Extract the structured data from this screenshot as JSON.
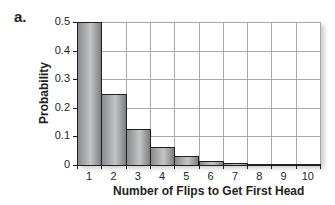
{
  "panel_label": "a.",
  "chart_data": {
    "type": "bar",
    "title": "",
    "xlabel": "Number of Flips to Get First Head",
    "ylabel": "Probability",
    "categories": [
      "1",
      "2",
      "3",
      "4",
      "5",
      "6",
      "7",
      "8",
      "9",
      "10"
    ],
    "values": [
      0.5,
      0.25,
      0.125,
      0.0625,
      0.03125,
      0.015625,
      0.0078,
      0.0039,
      0.002,
      0.001
    ],
    "ylim": [
      0,
      0.5
    ],
    "yticks": [
      "0",
      "0.1",
      "0.2",
      "0.3",
      "0.4",
      "0.5"
    ],
    "grid": true,
    "legend": null
  },
  "colors": {
    "bar_fill_dark": "#8a8b8d",
    "bar_fill_light": "#c4c5c7",
    "bar_edge": "#231f20",
    "grid": "#a7a9ac",
    "text": "#231f20"
  }
}
